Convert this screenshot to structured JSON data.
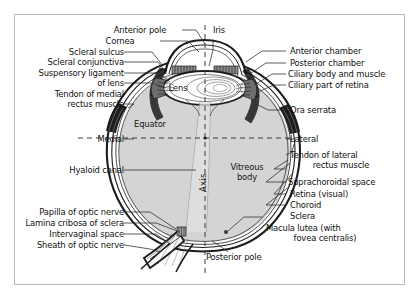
{
  "figure": {
    "type": "anatomical-diagram",
    "orientation": "horizontal section, medial at left, lateral at right",
    "colors": {
      "frame_border": "#b9b9b9",
      "background": "#ffffff",
      "vitreous_fill": "#d4d4d4",
      "lens_fill": "#ffffff",
      "ink": "#101010",
      "leader_line": "#2a2a2a",
      "dashed_line": "#3a3a3a"
    }
  },
  "labels_left": [
    {
      "id": "scleral-sulcus",
      "text": "Scleral sulcus"
    },
    {
      "id": "scleral-conjunctiva",
      "text": "Scleral conjunctiva"
    },
    {
      "id": "suspensory-ligament",
      "text": "Suspensory ligament"
    },
    {
      "id": "of-lens",
      "text": "of lens"
    },
    {
      "id": "tendon-medial-rectus",
      "text": "Tendon of medial"
    },
    {
      "id": "rectus-muscle",
      "text": "rectus muscle"
    },
    {
      "id": "medial",
      "text": "Medial"
    },
    {
      "id": "hyaloid-canal",
      "text": "Hyaloid canal"
    },
    {
      "id": "papilla-optic-nerve",
      "text": "Papilla of optic nerve"
    },
    {
      "id": "lamina-cribrosa",
      "text": "Lamina cribosa of sclera"
    },
    {
      "id": "intervaginal-space",
      "text": "Intervaginal space"
    },
    {
      "id": "sheath-optic-nerve",
      "text": "Sheath of optic nerve"
    }
  ],
  "labels_top": [
    {
      "id": "anterior-pole",
      "text": "Anterior pole"
    },
    {
      "id": "cornea",
      "text": "Cornea"
    },
    {
      "id": "iris",
      "text": "Iris"
    }
  ],
  "labels_right": [
    {
      "id": "anterior-chamber",
      "text": "Anterior chamber"
    },
    {
      "id": "posterior-chamber",
      "text": "Posterior chamber"
    },
    {
      "id": "ciliary-body-muscle",
      "text": "Ciliary body and muscle"
    },
    {
      "id": "ciliary-part-retina",
      "text": "Ciliary part of retina"
    },
    {
      "id": "ora-serrata",
      "text": "Ora serrata"
    },
    {
      "id": "lateral",
      "text": "Lateral"
    },
    {
      "id": "tendon-lateral-rectus",
      "text": "Tendon of lateral"
    },
    {
      "id": "lateral-rectus-muscle",
      "text": "rectus muscle"
    },
    {
      "id": "suprachoroidal-space",
      "text": "Suprachoroidal space"
    },
    {
      "id": "retina-visual",
      "text": "Retina (visual)"
    },
    {
      "id": "choroid",
      "text": "Choroid"
    },
    {
      "id": "sclera",
      "text": "Sclera"
    },
    {
      "id": "macula-lutea",
      "text": "Macula lutea (with"
    },
    {
      "id": "fovea-centralis",
      "text": "fovea centralis)"
    }
  ],
  "labels_inner": [
    {
      "id": "lens",
      "text": "Lens"
    },
    {
      "id": "equator",
      "text": "Equator"
    },
    {
      "id": "vitreous-body",
      "text": "Vitreous"
    },
    {
      "id": "vitreous-body2",
      "text": "body"
    },
    {
      "id": "axis",
      "text": "Axis"
    },
    {
      "id": "posterior-pole",
      "text": "Posterior pole"
    }
  ]
}
